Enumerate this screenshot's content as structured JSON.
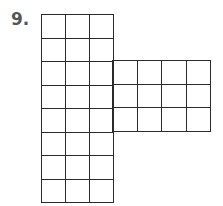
{
  "problem": {
    "number_label": "9.",
    "figure": {
      "description": "Grid net: 3-column by 8-row vertical strip with a 4-column by 3-row arm extending right from rows 3-5",
      "main_strip": {
        "columns": 3,
        "rows": 8
      },
      "arm": {
        "columns": 4,
        "rows": 3,
        "attached_rows": [
          3,
          5
        ]
      },
      "line_color": "#2a2a2a"
    }
  }
}
